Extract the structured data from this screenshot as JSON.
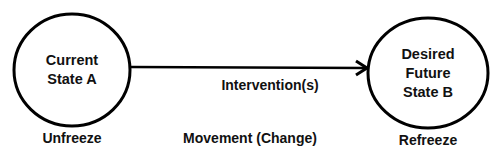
{
  "diagram": {
    "nodes": [
      {
        "id": "A",
        "lines": [
          "Current",
          "State A"
        ],
        "phase": "Unfreeze"
      },
      {
        "id": "B",
        "lines": [
          "Desired",
          "Future",
          "State B"
        ],
        "phase": "Refreeze"
      }
    ],
    "edge": {
      "from": "A",
      "to": "B",
      "label": "Intervention(s)"
    },
    "middle_phase": "Movement (Change)",
    "colors": {
      "stroke": "#000000",
      "text": "#111111",
      "background": "#ffffff"
    }
  }
}
